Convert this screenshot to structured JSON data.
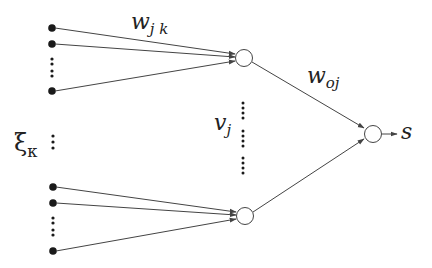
{
  "diagram": {
    "type": "neural-network",
    "labels": {
      "input_weight": {
        "base": "w",
        "sub": "j k"
      },
      "output_weight": {
        "base": "w",
        "sub": "oj"
      },
      "hidden_activation": {
        "base": "v",
        "sub": "j"
      },
      "input": {
        "base": "ξ",
        "sub": "κ"
      },
      "output": "s"
    },
    "colors": {
      "line": "#444444",
      "node_fill": "#ffffff",
      "input_dot": "#1a1a1a"
    },
    "input_groups": [
      {
        "visible_inputs": 3,
        "target": "hidden-node-top"
      },
      {
        "visible_inputs": 3,
        "target": "hidden-node-bottom"
      }
    ],
    "hidden_nodes": [
      "hidden-node-top",
      "hidden-node-bottom"
    ],
    "output_node": "output-node"
  }
}
